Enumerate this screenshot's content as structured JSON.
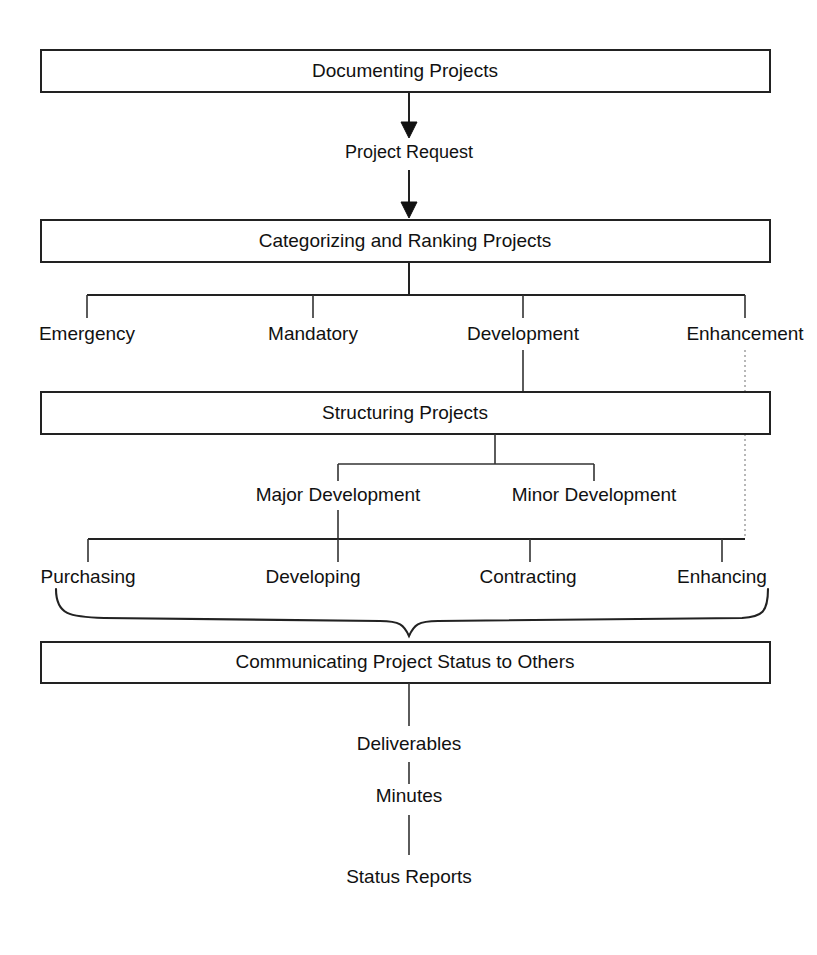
{
  "diagram": {
    "colors": {
      "stroke": "#222222",
      "text": "#111111",
      "background": "#ffffff",
      "dotted": "#999999"
    },
    "boxes": [
      {
        "id": "documenting",
        "label": "Documenting Projects"
      },
      {
        "id": "categorizing",
        "label": "Categorizing and Ranking Projects"
      },
      {
        "id": "structuring",
        "label": "Structuring Projects"
      },
      {
        "id": "communicating",
        "label": "Communicating Project Status to Others"
      }
    ],
    "flow_labels": [
      {
        "id": "project-request",
        "label": "Project Request"
      }
    ],
    "category_nodes": [
      {
        "id": "emergency",
        "label": "Emergency"
      },
      {
        "id": "mandatory",
        "label": "Mandatory"
      },
      {
        "id": "development",
        "label": "Development"
      },
      {
        "id": "enhancement",
        "label": "Enhancement"
      }
    ],
    "development_nodes": [
      {
        "id": "major-development",
        "label": "Major Development"
      },
      {
        "id": "minor-development",
        "label": "Minor Development"
      }
    ],
    "activity_nodes": [
      {
        "id": "purchasing",
        "label": "Purchasing"
      },
      {
        "id": "developing",
        "label": "Developing"
      },
      {
        "id": "contracting",
        "label": "Contracting"
      },
      {
        "id": "enhancing",
        "label": "Enhancing"
      }
    ],
    "output_nodes": [
      {
        "id": "deliverables",
        "label": "Deliverables"
      },
      {
        "id": "minutes",
        "label": "Minutes"
      },
      {
        "id": "status-reports",
        "label": "Status Reports"
      }
    ]
  }
}
